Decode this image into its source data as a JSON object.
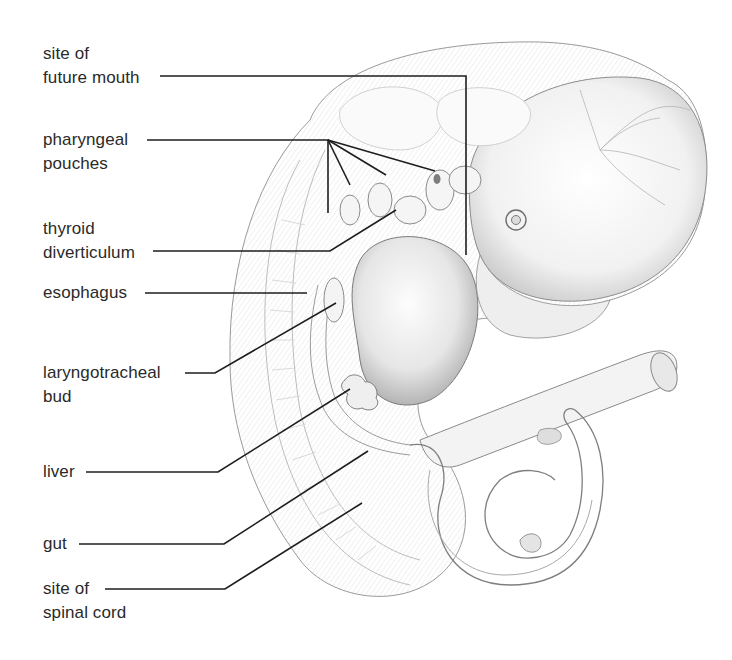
{
  "diagram": {
    "labels": [
      {
        "id": "mouth",
        "lines": [
          "site of",
          "future mouth"
        ]
      },
      {
        "id": "pharyngeal",
        "lines": [
          "pharyngeal",
          "pouches"
        ]
      },
      {
        "id": "thyroid",
        "lines": [
          "thyroid",
          "diverticulum"
        ]
      },
      {
        "id": "esophagus",
        "lines": [
          "esophagus"
        ]
      },
      {
        "id": "laryngo",
        "lines": [
          "laryngotracheal",
          "bud"
        ]
      },
      {
        "id": "liver",
        "lines": [
          "liver"
        ]
      },
      {
        "id": "gut",
        "lines": [
          "gut"
        ]
      },
      {
        "id": "spinal",
        "lines": [
          "site of",
          "spinal cord"
        ]
      }
    ],
    "colors": {
      "line": "#1e1e1e",
      "text": "#2a2a2a",
      "sketch": "#8a8a8a",
      "shade": "#c8c8c8"
    }
  }
}
